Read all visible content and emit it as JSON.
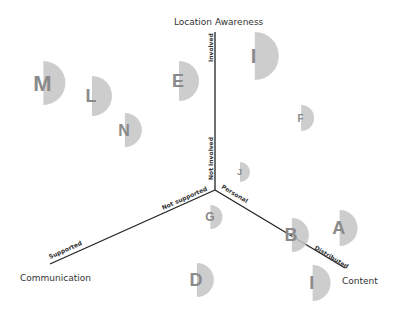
{
  "axes": {
    "location": {
      "title": "Location Awareness",
      "high": "Involved",
      "low": "Not Involved"
    },
    "communication": {
      "title": "Communication",
      "high": "Supported",
      "low": "Not supported"
    },
    "content": {
      "title": "Content",
      "high": "Distributed",
      "low": "Personal"
    }
  },
  "points": [
    {
      "label": "M",
      "x": 50,
      "y": 83,
      "r": 22,
      "size": 22
    },
    {
      "label": "L",
      "x": 98,
      "y": 96,
      "r": 20,
      "size": 18
    },
    {
      "label": "N",
      "x": 130,
      "y": 130,
      "r": 17,
      "size": 16
    },
    {
      "label": "E",
      "x": 185,
      "y": 81,
      "r": 20,
      "size": 18
    },
    {
      "label": "I",
      "x": 262,
      "y": 56,
      "r": 24,
      "size": 20
    },
    {
      "label": "F",
      "x": 305,
      "y": 118,
      "r": 13,
      "size": 10
    },
    {
      "label": "J",
      "x": 243,
      "y": 172,
      "r": 10,
      "size": 9
    },
    {
      "label": "G",
      "x": 214,
      "y": 217,
      "r": 12,
      "size": 12
    },
    {
      "label": "D",
      "x": 202,
      "y": 280,
      "r": 17,
      "size": 18
    },
    {
      "label": "B",
      "x": 297,
      "y": 235,
      "r": 17,
      "size": 18
    },
    {
      "label": "A",
      "x": 345,
      "y": 228,
      "r": 18,
      "size": 18
    },
    {
      "label": "I",
      "x": 318,
      "y": 283,
      "r": 18,
      "size": 18
    }
  ]
}
